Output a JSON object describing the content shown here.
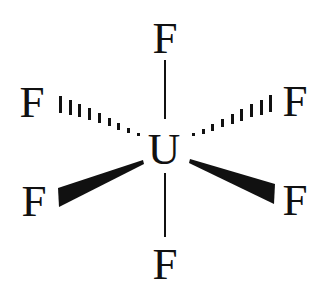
{
  "diagram": {
    "type": "molecular-structure",
    "molecule": "UF6",
    "geometry": "octahedral",
    "central_atom": {
      "label": "U",
      "x": 164,
      "y": 148
    },
    "ligands": [
      {
        "id": "top",
        "label": "F",
        "x": 165,
        "y": 36,
        "bond": "plain"
      },
      {
        "id": "upper-left",
        "label": "F",
        "x": 32,
        "y": 100,
        "bond": "hashed-wedge"
      },
      {
        "id": "upper-right",
        "label": "F",
        "x": 295,
        "y": 100,
        "bond": "hashed-wedge"
      },
      {
        "id": "lower-left",
        "label": "F",
        "x": 34,
        "y": 199,
        "bond": "solid-wedge"
      },
      {
        "id": "lower-right",
        "label": "F",
        "x": 295,
        "y": 198,
        "bond": "solid-wedge"
      },
      {
        "id": "bottom",
        "label": "F",
        "x": 165,
        "y": 262,
        "bond": "plain"
      }
    ],
    "colors": {
      "ink": "#111111",
      "background": "#ffffff"
    }
  }
}
